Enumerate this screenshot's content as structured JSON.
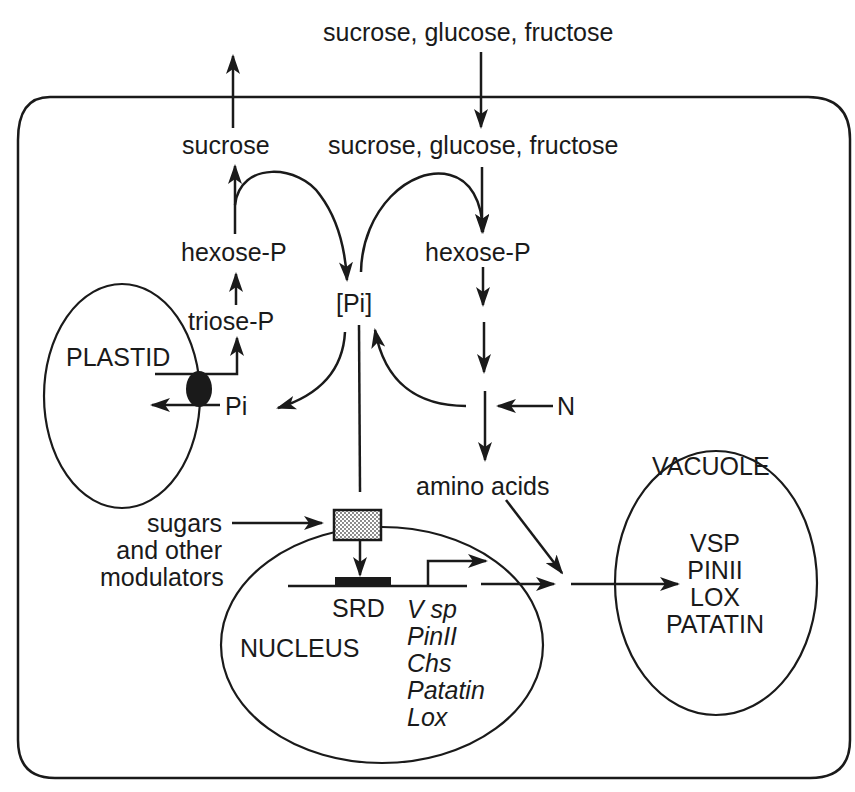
{
  "diagram": {
    "type": "cell-schematic",
    "colors": {
      "ink": "#1a1a1a",
      "background": "#ffffff",
      "stipple": "#9a9a9a"
    },
    "external": {
      "input_sugars": "sucrose, glucose, fructose"
    },
    "cytosol": {
      "sucrose_out": "sucrose",
      "sugars_in": "sucrose, glucose, fructose",
      "hexose_p_left": "hexose-P",
      "hexose_p_right": "hexose-P",
      "triose_p": "triose-P",
      "pi_pool": "[Pi]",
      "pi_transporter_label": "Pi",
      "nitrogen": "N",
      "amino_acids": "amino acids",
      "modulators": [
        "sugars",
        "and other",
        "modulators"
      ]
    },
    "plastid": {
      "label": "PLASTID"
    },
    "nucleus": {
      "label": "NUCLEUS",
      "element": "SRD",
      "genes": [
        "V sp",
        "PinII",
        "Chs",
        "Patatin",
        "Lox"
      ]
    },
    "vacuole": {
      "label": "VACUOLE",
      "proteins": [
        "VSP",
        "PINII",
        "LOX",
        "PATATIN"
      ]
    }
  }
}
